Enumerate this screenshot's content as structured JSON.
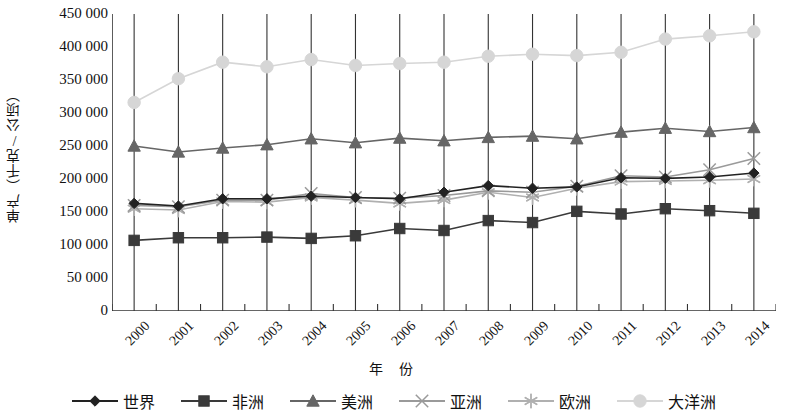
{
  "chart_data": {
    "type": "line",
    "title": "",
    "xlabel": "年 份",
    "ylabel": "单产（千克/公顷）",
    "categories": [
      "2000",
      "2001",
      "2002",
      "2003",
      "2004",
      "2005",
      "2006",
      "2007",
      "2008",
      "2009",
      "2010",
      "2011",
      "2012",
      "2013",
      "2014"
    ],
    "ylim": [
      0,
      450000
    ],
    "ytick_labels": [
      "450 000",
      "400 000",
      "350 000",
      "300 000",
      "250 000",
      "200 000",
      "150 000",
      "100 000",
      "50 000",
      "0"
    ],
    "ytick_values": [
      450000,
      400000,
      350000,
      300000,
      250000,
      200000,
      150000,
      100000,
      50000,
      0
    ],
    "grid": "vertical",
    "legend_position": "bottom",
    "series": [
      {
        "name": "世界",
        "marker": "diamond",
        "color": "#222222",
        "values": [
          163000,
          159000,
          170000,
          170000,
          174000,
          172000,
          170000,
          180000,
          190000,
          186000,
          188000,
          202000,
          201000,
          203000,
          209000
        ]
      },
      {
        "name": "非洲",
        "marker": "square",
        "color": "#3a3a3a",
        "values": [
          107000,
          111000,
          111000,
          112000,
          110000,
          114000,
          125000,
          122000,
          137000,
          134000,
          151000,
          147000,
          155000,
          152000,
          148000
        ]
      },
      {
        "name": "美洲",
        "marker": "triangle",
        "color": "#666666",
        "values": [
          250000,
          241000,
          247000,
          252000,
          261000,
          255000,
          262000,
          258000,
          263000,
          265000,
          261000,
          271000,
          277000,
          272000,
          278000
        ]
      },
      {
        "name": "亚洲",
        "marker": "x",
        "color": "#9a9a9a",
        "values": [
          160000,
          158000,
          168000,
          168000,
          178000,
          172000,
          171000,
          175000,
          182000,
          180000,
          189000,
          205000,
          203000,
          214000,
          231000
        ]
      },
      {
        "name": "欧洲",
        "marker": "asterisk",
        "color": "#b0b0b0",
        "values": [
          155000,
          153000,
          166000,
          165000,
          172000,
          168000,
          163000,
          168000,
          180000,
          172000,
          186000,
          196000,
          197000,
          198000,
          200000
        ]
      },
      {
        "name": "大洋洲",
        "marker": "circle",
        "color": "#d6d6d6",
        "values": [
          316000,
          352000,
          377000,
          370000,
          381000,
          372000,
          375000,
          377000,
          386000,
          389000,
          387000,
          392000,
          412000,
          417000,
          423000
        ]
      }
    ]
  }
}
